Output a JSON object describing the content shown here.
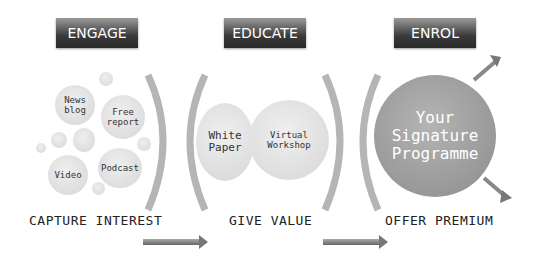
{
  "stages": [
    {
      "header": "ENGAGE",
      "footer": "CAPTURE INTEREST",
      "items": [
        "News\nblog",
        "Free\nreport",
        "Video",
        "Podcast"
      ]
    },
    {
      "header": "EDUCATE",
      "footer": "GIVE VALUE",
      "items": [
        "White\nPaper",
        "Virtual\nWorkshop"
      ]
    },
    {
      "header": "ENROL",
      "footer": "OFFER PREMIUM",
      "items": [
        "Your\nSignature\nProgramme"
      ]
    }
  ],
  "colors": {
    "header_dark": "#2a2a2a",
    "bubble": "#dcdcdc",
    "big_bubble": "#9a9a9a",
    "arc": "#b0b0b0",
    "arrow": "#8a8a8a"
  }
}
